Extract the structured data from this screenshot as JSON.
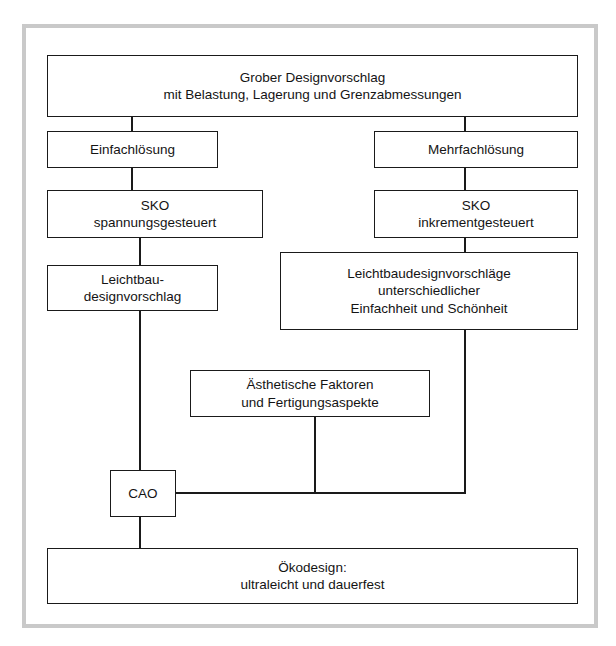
{
  "diagram": {
    "line_color": "#1a1a1a",
    "box_fill": "#ffffff",
    "frame_color": "#c9c9c9",
    "nodes": {
      "grober_designvorschlag": {
        "line1": "Grober Designvorschlag",
        "line2": "mit Belastung, Lagerung und Grenzabmessungen"
      },
      "einfachloesung": {
        "line1": "Einfachlösung"
      },
      "mehrfachloesung": {
        "line1": "Mehrfachlösung"
      },
      "sko_spannungsgesteuert": {
        "line1": "SKO",
        "line2": "spannungsgesteuert"
      },
      "sko_inkrementgesteuert": {
        "line1": "SKO",
        "line2": "inkrementgesteuert"
      },
      "leichtbau_designvorschlag": {
        "line1": "Leichtbau-",
        "line2": "designvorschlag"
      },
      "leichtbaudesignvorschlaege": {
        "line1": "Leichtbaudesignvorschläge",
        "line2": "unterschiedlicher",
        "line3": "Einfachheit und Schönheit"
      },
      "aesthetische_faktoren": {
        "line1": "Ästhetische Faktoren",
        "line2": "und Fertigungsaspekte"
      },
      "cao": {
        "line1": "CAO"
      },
      "oekodesign": {
        "line1": "Ökodesign:",
        "line2": "ultraleicht und dauerfest"
      }
    }
  }
}
